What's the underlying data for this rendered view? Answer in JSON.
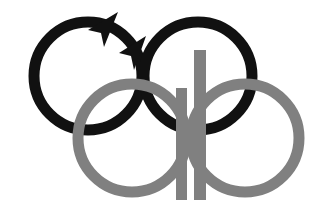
{
  "artwork": {
    "title": "Interlocking rings emblem",
    "kind": "logo-mark",
    "background_color": "#ffffff",
    "canvas": {
      "width": 333,
      "height": 216
    },
    "palette": {
      "black": "#111111",
      "gray": "#808080",
      "white": "#ffffff"
    },
    "rings": [
      {
        "name": "top-left-ring",
        "color_role": "black",
        "color": "#111111",
        "cx": 88,
        "cy": 76,
        "r": 54,
        "stroke_width": 11,
        "has_arrowheads": true,
        "arrowhead_count": 2,
        "rotation_hint": "counterclockwise"
      },
      {
        "name": "top-right-ring",
        "color_role": "black",
        "color": "#111111",
        "cx": 198,
        "cy": 76,
        "r": 54,
        "stroke_width": 11,
        "has_arrowheads": false,
        "arrowhead_count": 0,
        "rotation_hint": "none"
      },
      {
        "name": "bottom-left-ring",
        "color_role": "gray",
        "color": "#808080",
        "cx": 132,
        "cy": 138,
        "r": 54,
        "stroke_width": 11,
        "has_arrowheads": false,
        "arrowhead_count": 0,
        "rotation_hint": "none"
      },
      {
        "name": "bottom-right-ring",
        "color_role": "gray",
        "color": "#808080",
        "cx": 245,
        "cy": 138,
        "r": 54,
        "stroke_width": 11,
        "has_arrowheads": false,
        "arrowhead_count": 0,
        "rotation_hint": "none"
      }
    ],
    "bars": [
      {
        "name": "short-bar",
        "color_role": "gray",
        "color": "#808080",
        "x": 176,
        "y": 88,
        "width": 11,
        "height": 112
      },
      {
        "name": "tall-bar",
        "color_role": "gray",
        "color": "#808080",
        "x": 194,
        "y": 50,
        "width": 12,
        "height": 150
      }
    ],
    "arrowheads": [
      {
        "name": "upper-arrowhead",
        "color": "#111111",
        "points": "118,12 88,30 101,33 104,47",
        "direction": "up-left"
      },
      {
        "name": "lower-arrowhead",
        "color": "#111111",
        "points": "146,36 119,53 131,56 134,70",
        "direction": "up-left"
      }
    ]
  }
}
